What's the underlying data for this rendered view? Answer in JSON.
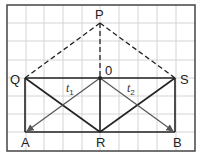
{
  "diagram": {
    "type": "vector-geometry-on-grid",
    "points": {
      "P": {
        "label": "P",
        "x": 100,
        "y": 23
      },
      "Q": {
        "label": "Q",
        "x": 25,
        "y": 78
      },
      "O": {
        "label": "0",
        "x": 100,
        "y": 78
      },
      "S": {
        "label": "S",
        "x": 175,
        "y": 78
      },
      "A": {
        "label": "A",
        "x": 25,
        "y": 132
      },
      "R": {
        "label": "R",
        "x": 100,
        "y": 132
      },
      "B": {
        "label": "B",
        "x": 176,
        "y": 132
      }
    },
    "vectors": {
      "t1": {
        "symbol": "t",
        "subscript": "1",
        "from": "O",
        "to": "A"
      },
      "t2": {
        "symbol": "t",
        "subscript": "2",
        "from": "O",
        "to": "B"
      }
    },
    "dashed_segments": [
      [
        "Q",
        "P"
      ],
      [
        "P",
        "S"
      ],
      [
        "P",
        "O"
      ]
    ],
    "solid_segments": [
      [
        "Q",
        "S"
      ],
      [
        "Q",
        "A"
      ],
      [
        "S",
        "B"
      ],
      [
        "A",
        "B"
      ],
      [
        "O",
        "R"
      ],
      [
        "Q",
        "R"
      ],
      [
        "S",
        "R"
      ]
    ],
    "colors": {
      "grid": "#cfcfcf",
      "frame": "#444444",
      "line": "#222222",
      "arrow": "#555555"
    }
  }
}
